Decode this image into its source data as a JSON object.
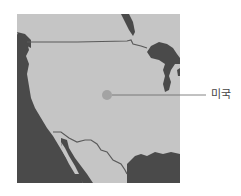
{
  "map": {
    "region": "United States",
    "colors": {
      "land": "#c5c5c5",
      "water": "#4a4a4a",
      "border": "#5a5a5a",
      "marker": "#a3a3a3",
      "leader_line": "#666666"
    }
  },
  "marker": {
    "label": "미국"
  }
}
